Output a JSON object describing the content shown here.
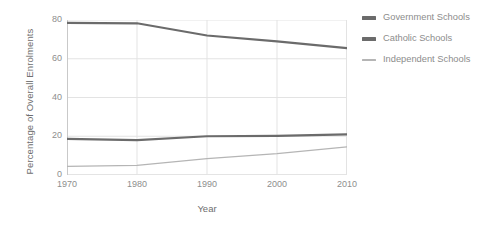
{
  "chart_data": {
    "type": "line",
    "title": "",
    "xlabel": "Year",
    "ylabel": "Percentage of Overall Enrolments",
    "x": [
      1970,
      1980,
      1990,
      2000,
      2010
    ],
    "xtick_labels": [
      "1970",
      "1980",
      "1990",
      "2000",
      "2010"
    ],
    "ytick_labels": [
      "0",
      "20",
      "40",
      "60",
      "80"
    ],
    "yticks": [
      0,
      20,
      40,
      60,
      80
    ],
    "xlim": [
      1970,
      2010
    ],
    "ylim": [
      0,
      80
    ],
    "grid": true,
    "legend_position": "right",
    "series": [
      {
        "name": "Government Schools",
        "values": [
          78.5,
          78.3,
          72.0,
          69.0,
          65.5
        ],
        "color": "#6b6b6b",
        "width": 2.2
      },
      {
        "name": "Catholic Schools",
        "values": [
          18.6,
          18.0,
          20.0,
          20.2,
          21.0
        ],
        "color": "#6b6b6b",
        "width": 2.2
      },
      {
        "name": "Independent Schools",
        "values": [
          4.5,
          5.0,
          8.5,
          11.0,
          14.5
        ],
        "color": "#b5b5b5",
        "width": 1.2
      }
    ]
  },
  "legend": {
    "items": [
      {
        "label": "Government Schools",
        "color": "#6b6b6b"
      },
      {
        "label": "Catholic Schools",
        "color": "#6b6b6b"
      },
      {
        "label": "Independent Schools",
        "color": "#b5b5b5"
      }
    ]
  },
  "colors": {
    "background": "#ffffff",
    "grid": "#e3e3e3",
    "axis": "#c9c9c9",
    "text": "#8a8a8a"
  }
}
